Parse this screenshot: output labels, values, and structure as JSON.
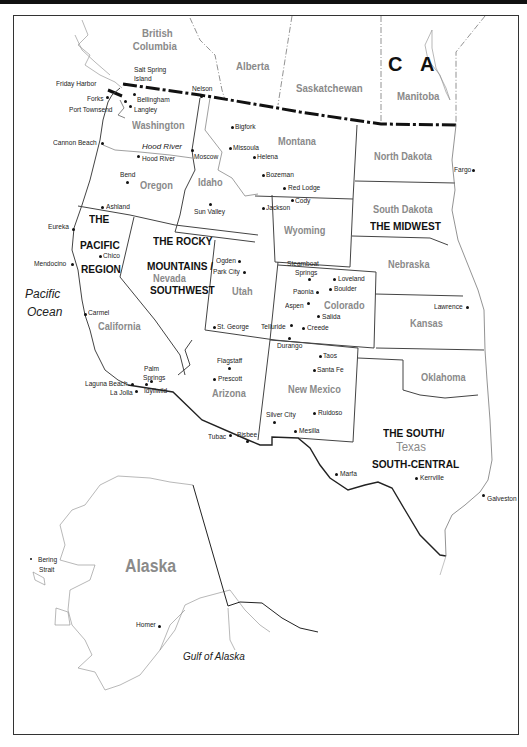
{
  "map": {
    "title": "Western United States and Alaska Regions",
    "country_label": [
      "C",
      "A"
    ],
    "provinces": [
      {
        "name": "British Columbia",
        "line1": "British",
        "line2": "Columbia"
      },
      {
        "name": "Alberta"
      },
      {
        "name": "Saskatchewan"
      },
      {
        "name": "Manitoba"
      }
    ],
    "states": {
      "washington": "Washington",
      "oregon": "Oregon",
      "idaho": "Idaho",
      "montana": "Montana",
      "wyoming": "Wyoming",
      "california": "California",
      "nevada": "Nevada",
      "utah": "Utah",
      "colorado": "Colorado",
      "arizona": "Arizona",
      "new_mexico": "New Mexico",
      "north_dakota": "North Dakota",
      "south_dakota": "South Dakota",
      "nebraska": "Nebraska",
      "kansas": "Kansas",
      "oklahoma": "Oklahoma",
      "texas": "Texas",
      "alaska": "Alaska"
    },
    "regions": {
      "pacific": [
        "THE",
        "PACIFIC",
        "REGION"
      ],
      "rocky": [
        "THE ROCKY",
        "MOUNTAINS /",
        "SOUTHWEST"
      ],
      "midwest": "THE MIDWEST",
      "south": [
        "THE SOUTH/",
        "SOUTH-CENTRAL"
      ]
    },
    "water": {
      "pacific_ocean": [
        "Pacific",
        "Ocean"
      ],
      "gulf_of_alaska": "Gulf of Alaska",
      "bering_strait": [
        "Bering",
        "Strait"
      ],
      "hood_river_river": "Hood River"
    },
    "cities": {
      "salt_spring_island": [
        "Salt Spring",
        "Island"
      ],
      "friday_harbor": "Friday Harbor",
      "forks": "Forks",
      "port_townsend": "Port Townsend",
      "bellingham": "Bellingham",
      "langley": "Langley",
      "nelson": "Nelson",
      "cannon_beach": "Cannon Beach",
      "hood_river": "Hood River",
      "moscow": "Moscow",
      "bigfork": "Bigfork",
      "missoula": "Missoula",
      "helena": "Helena",
      "bozeman": "Bozeman",
      "red_lodge": "Red Lodge",
      "cody": "Cody",
      "jackson": "Jackson",
      "bend": "Bend",
      "ashland": "Ashland",
      "sun_valley": "Sun Valley",
      "eureka": "Eureka",
      "chico": "Chico",
      "mendocino": "Mendocino",
      "carmel": "Carmel",
      "ogden": "Ogden",
      "park_city": "Park City",
      "st_george": "St. George",
      "steamboat_springs": [
        "Steamboat",
        "Springs"
      ],
      "loveland": "Loveland",
      "boulder": "Boulder",
      "paonia": "Paonia",
      "aspen": "Aspen",
      "salida": "Salida",
      "telluride": "Telluride",
      "creede": "Creede",
      "durango": "Durango",
      "taos": "Taos",
      "santa_fe": "Santa Fe",
      "flagstaff": "Flagstaff",
      "prescott": "Prescott",
      "palm_springs": [
        "Palm",
        "Springs"
      ],
      "idyllwild": "Idyllwild",
      "laguna_beach": "Laguna Beach",
      "la_jolla": "La Jolla",
      "silver_city": "Silver City",
      "ruidoso": "Ruidoso",
      "mesilla": "Mesilla",
      "tubac": "Tubac",
      "bisbee": "Bisbee",
      "marfa": "Marfa",
      "kerrville": "Kerrville",
      "galveston": "Galveston",
      "fargo": "Fargo",
      "lawrence": "Lawrence",
      "homer": "Homer"
    },
    "colors": {
      "border": "#333333",
      "state_label": "#8a8a8a",
      "region_label": "#111111",
      "background": "#ffffff"
    }
  }
}
